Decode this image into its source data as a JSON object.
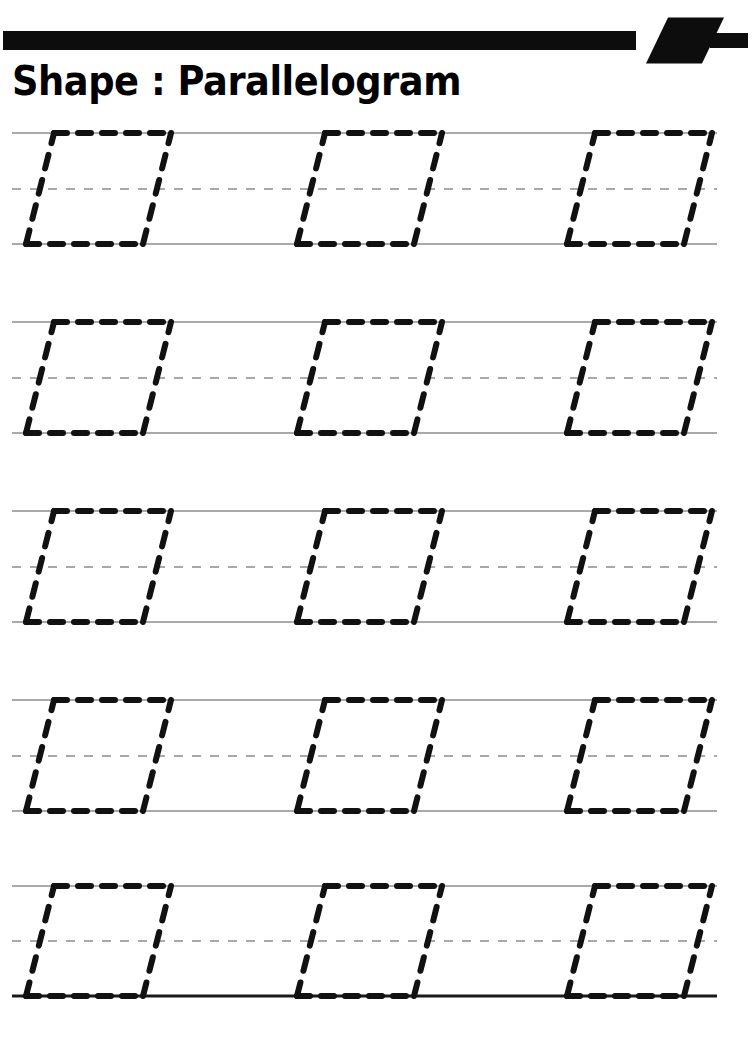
{
  "page": {
    "width": 752,
    "height": 1039,
    "background_color": "#ffffff",
    "type": "tracing-worksheet"
  },
  "header": {
    "title": "Shape : Parallelogram",
    "shape_name": "Parallelogram",
    "label_prefix": "Shape :",
    "rule_color": "#0d0d0d",
    "decoration_icon": "parallelogram-icon",
    "rule": {
      "x": 3,
      "y": 31,
      "main_bar_end": 636,
      "thickness": 19,
      "gap_before_badge": 8,
      "badge_bottom_left": 646,
      "badge_width": 56,
      "badge_skew": 22,
      "badge_height": 46,
      "tail_start": 710,
      "tail_end": 748
    }
  },
  "worksheet": {
    "line_color": "#8c8c8c",
    "baseline_color": "#1a1a1a",
    "trace_color": "#111111",
    "row_count": 5,
    "shapes_per_row": 3,
    "line_start_x": 12,
    "line_end_x": 717,
    "row_height": 110,
    "rows": [
      {
        "index": 1,
        "top_y": 133,
        "mid_y": 189,
        "bottom_y": 244,
        "baseline_bold": false
      },
      {
        "index": 2,
        "top_y": 322,
        "mid_y": 378,
        "bottom_y": 433,
        "baseline_bold": false
      },
      {
        "index": 3,
        "top_y": 511,
        "mid_y": 567,
        "bottom_y": 622,
        "baseline_bold": false
      },
      {
        "index": 4,
        "top_y": 700,
        "mid_y": 756,
        "bottom_y": 811,
        "baseline_bold": false
      },
      {
        "index": 5,
        "top_y": 886,
        "mid_y": 941,
        "bottom_y": 996,
        "baseline_bold": true
      }
    ],
    "shape": {
      "name": "parallelogram",
      "bottom_left_xs": [
        26,
        297,
        567
      ],
      "base_width": 117,
      "slant_offset": 28,
      "stroke_width": 6,
      "dash_pattern": "13 11",
      "side_dash_pattern": "14 12"
    }
  }
}
